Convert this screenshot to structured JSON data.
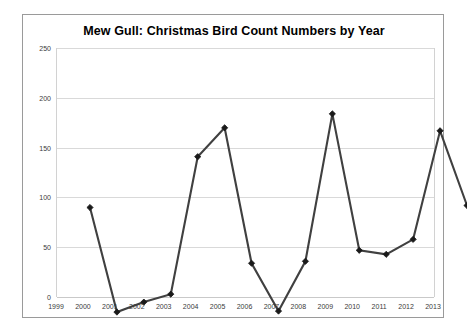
{
  "chart_data": {
    "type": "line",
    "title": "Mew Gull: Christmas Bird Count Numbers by Year",
    "xlabel": "",
    "ylabel": "",
    "categories": [
      "1999",
      "2000",
      "2001",
      "2002",
      "2003",
      "2004",
      "2005",
      "2006",
      "2007",
      "2008",
      "2009",
      "2010",
      "2011",
      "2012",
      "2013"
    ],
    "values": [
      123,
      18,
      28,
      36,
      174,
      203,
      67,
      19,
      69,
      217,
      80,
      76,
      91,
      200,
      125
    ],
    "series": [
      {
        "name": "Mew Gull",
        "values": [
          123,
          18,
          28,
          36,
          174,
          203,
          67,
          19,
          69,
          217,
          80,
          76,
          91,
          200,
          125
        ]
      }
    ],
    "ylim": [
      0,
      250
    ],
    "yticks": [
      0,
      50,
      100,
      150,
      200,
      250
    ],
    "ytick_labels": [
      "0",
      "50",
      "100",
      "150",
      "200",
      "250"
    ],
    "xtick_labels": [
      "1999",
      "2000",
      "2001",
      "2002",
      "2003",
      "2004",
      "2005",
      "2006",
      "2007",
      "2008",
      "2009",
      "2010",
      "2011",
      "2012",
      "2013"
    ],
    "grid": true,
    "legend": false,
    "legend_position": "none",
    "marker": "diamond",
    "line_color": "#404040",
    "marker_color": "#1a1a1a",
    "grid_color": "#d9d9d9",
    "plot_background": "#ffffff",
    "border_color": "#9a9a9a"
  }
}
